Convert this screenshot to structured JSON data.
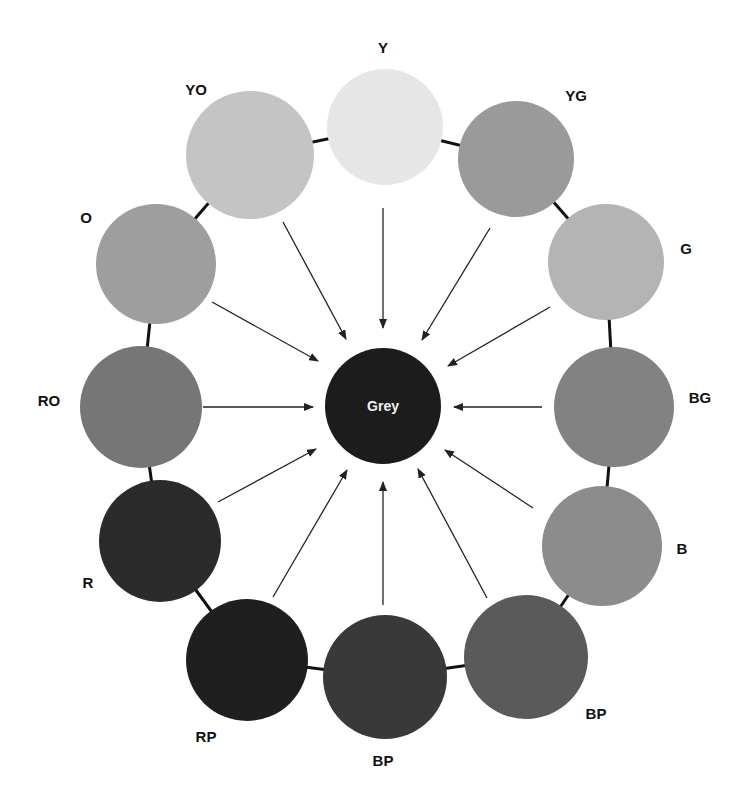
{
  "diagram": {
    "title": "Grey",
    "center": {
      "label": "Grey",
      "x": 383,
      "y": 406,
      "r": 58,
      "color": "#1c1c1c"
    },
    "ring_color": "#111111",
    "arrow_color": "#222222",
    "swatches": [
      {
        "label": "Y",
        "x": 385,
        "y": 127,
        "r": 58,
        "color": "#e6e6e6",
        "lx": 383,
        "ly": 47,
        "ax1": 383,
        "ay1": 208,
        "ax2": 383,
        "ay2": 328
      },
      {
        "label": "YG",
        "x": 516,
        "y": 159,
        "r": 58,
        "color": "#9a9a9a",
        "lx": 576,
        "ly": 95,
        "ax1": 490,
        "ay1": 228,
        "ax2": 422,
        "ay2": 340
      },
      {
        "label": "G",
        "x": 606,
        "y": 262,
        "r": 58,
        "color": "#b4b4b4",
        "lx": 686,
        "ly": 248,
        "ax1": 550,
        "ay1": 307,
        "ax2": 448,
        "ay2": 366
      },
      {
        "label": "BG",
        "x": 614,
        "y": 407,
        "r": 60,
        "color": "#828282",
        "lx": 700,
        "ly": 397,
        "ax1": 542,
        "ay1": 407,
        "ax2": 454,
        "ay2": 407
      },
      {
        "label": "B",
        "x": 602,
        "y": 546,
        "r": 60,
        "color": "#8c8c8c",
        "lx": 682,
        "ly": 548,
        "ax1": 533,
        "ay1": 508,
        "ax2": 445,
        "ay2": 450
      },
      {
        "label": "BP",
        "x": 526,
        "y": 657,
        "r": 62,
        "color": "#5a5a5a",
        "lx": 596,
        "ly": 713,
        "ax1": 487,
        "ay1": 598,
        "ax2": 418,
        "ay2": 469
      },
      {
        "label": "BP",
        "x": 385,
        "y": 677,
        "r": 62,
        "color": "#393939",
        "lx": 383,
        "ly": 760,
        "ax1": 383,
        "ay1": 605,
        "ax2": 383,
        "ay2": 482
      },
      {
        "label": "RP",
        "x": 247,
        "y": 660,
        "r": 61,
        "color": "#1f1f1f",
        "lx": 206,
        "ly": 736,
        "ax1": 273,
        "ay1": 597,
        "ax2": 347,
        "ay2": 470
      },
      {
        "label": "R",
        "x": 160,
        "y": 541,
        "r": 61,
        "color": "#2b2b2b",
        "lx": 88,
        "ly": 582,
        "ax1": 218,
        "ay1": 502,
        "ax2": 316,
        "ay2": 449
      },
      {
        "label": "RO",
        "x": 141,
        "y": 407,
        "r": 61,
        "color": "#767676",
        "lx": 49,
        "ly": 400,
        "ax1": 203,
        "ay1": 407,
        "ax2": 313,
        "ay2": 407
      },
      {
        "label": "O",
        "x": 156,
        "y": 264,
        "r": 60,
        "color": "#9e9e9e",
        "lx": 86,
        "ly": 217,
        "ax1": 212,
        "ay1": 302,
        "ax2": 318,
        "ay2": 361
      },
      {
        "label": "YO",
        "x": 250,
        "y": 155,
        "r": 64,
        "color": "#c4c4c4",
        "lx": 196,
        "ly": 89,
        "ax1": 283,
        "ay1": 222,
        "ax2": 346,
        "ay2": 339
      }
    ]
  }
}
